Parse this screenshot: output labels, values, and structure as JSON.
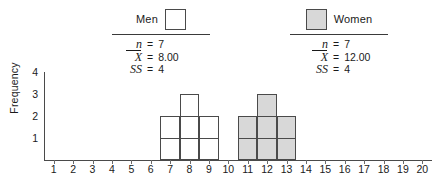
{
  "chart_data": {
    "type": "bar",
    "title": "",
    "xlabel": "",
    "ylabel": "Frequency",
    "xlim": [
      0.5,
      20.5
    ],
    "ylim": [
      0,
      4
    ],
    "grid": false,
    "x_ticks": [
      1,
      2,
      3,
      4,
      5,
      6,
      7,
      8,
      9,
      10,
      11,
      12,
      13,
      14,
      15,
      16,
      17,
      18,
      19,
      20
    ],
    "y_ticks": [
      1,
      2,
      3,
      4
    ],
    "categories": [
      1,
      2,
      3,
      4,
      5,
      6,
      7,
      8,
      9,
      10,
      11,
      12,
      13,
      14,
      15,
      16,
      17,
      18,
      19,
      20
    ],
    "series": [
      {
        "name": "Men",
        "fill": "#ffffff",
        "values": [
          0,
          0,
          0,
          0,
          0,
          0,
          2,
          3,
          2,
          0,
          0,
          0,
          0,
          0,
          0,
          0,
          0,
          0,
          0,
          0
        ]
      },
      {
        "name": "Women",
        "fill": "#d8d8d8",
        "values": [
          0,
          0,
          0,
          0,
          0,
          0,
          0,
          0,
          0,
          0,
          2,
          3,
          2,
          0,
          0,
          0,
          0,
          0,
          0,
          0
        ]
      }
    ]
  },
  "axes": {
    "y_title": "Frequency",
    "y_tick_labels": [
      "1",
      "2",
      "3",
      "4"
    ],
    "x_tick_labels": [
      "1",
      "2",
      "3",
      "4",
      "5",
      "6",
      "7",
      "8",
      "9",
      "10",
      "11",
      "12",
      "13",
      "14",
      "15",
      "16",
      "17",
      "18",
      "19",
      "20"
    ]
  },
  "legends": [
    {
      "id": "men",
      "label": "Men",
      "swatch": "open-square-white",
      "stats": [
        {
          "symbol": "n",
          "equals": "=",
          "value": "7"
        },
        {
          "symbol": "X",
          "equals": "=",
          "value": "8.00"
        },
        {
          "symbol": "SS",
          "equals": "=",
          "value": "4"
        }
      ]
    },
    {
      "id": "women",
      "label": "Women",
      "swatch": "filled-square-gray",
      "stats": [
        {
          "symbol": "n",
          "equals": "=",
          "value": "7"
        },
        {
          "symbol": "X",
          "equals": "=",
          "value": "12.00"
        },
        {
          "symbol": "SS",
          "equals": "=",
          "value": "4"
        }
      ]
    }
  ],
  "colors": {
    "men_fill": "#ffffff",
    "women_fill": "#d8d8d8",
    "stroke": "#4a4a4a",
    "text": "#1a1a1a"
  }
}
